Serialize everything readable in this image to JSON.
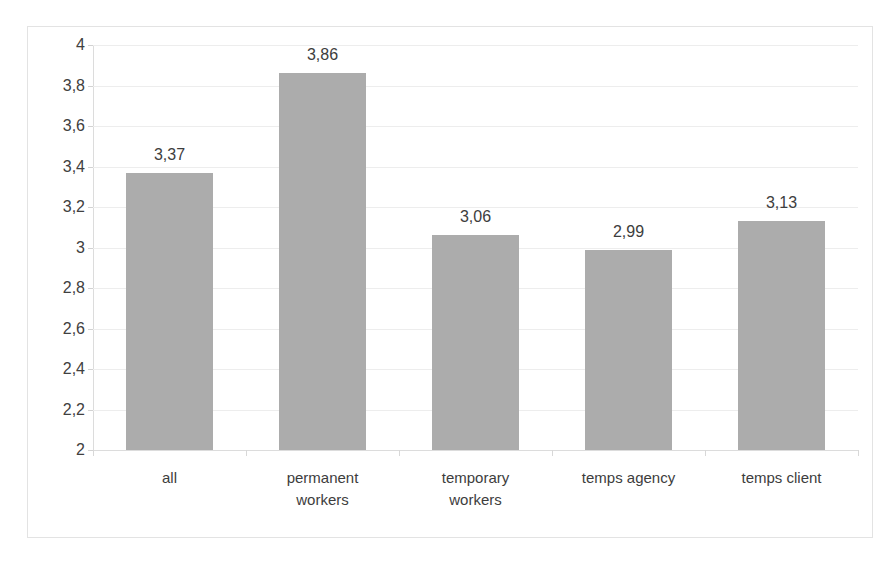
{
  "chart_data": {
    "type": "bar",
    "title": "",
    "subtitle": "",
    "xlabel": "",
    "ylabel": "",
    "categories": [
      "all",
      "permanent workers",
      "temporary workers",
      "temps agency",
      "temps client"
    ],
    "category_lines": [
      [
        "all"
      ],
      [
        "permanent",
        "workers"
      ],
      [
        "temporary",
        "workers"
      ],
      [
        "temps agency"
      ],
      [
        "temps client"
      ]
    ],
    "values": [
      3.37,
      3.86,
      3.06,
      2.99,
      3.13
    ],
    "data_labels": [
      "3,37",
      "3,86",
      "3,06",
      "2,99",
      "3,13"
    ],
    "ylim": [
      2,
      4
    ],
    "ytick_step": 0.2,
    "ytick_labels": [
      "4",
      "3,8",
      "3,6",
      "3,4",
      "3,2",
      "3",
      "2,8",
      "2,6",
      "2,4",
      "2,2",
      "2"
    ],
    "ytick_values": [
      4,
      3.8,
      3.6,
      3.4,
      3.2,
      3,
      2.8,
      2.6,
      2.4,
      2.2,
      2
    ],
    "decimal_separator": ",",
    "grid": true,
    "legend": "none",
    "colors": {
      "bar_fill": "#acacac",
      "gridline": "#ededed",
      "axis_line": "#dcdcdc",
      "frame_border": "#e3e3e3",
      "label_text": "#3d3d3d",
      "tick_text": "#404040",
      "background": "#ffffff"
    }
  }
}
